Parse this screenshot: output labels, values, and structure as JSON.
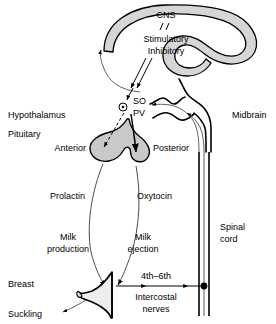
{
  "figure": {
    "background": "#ffffff",
    "width": 276,
    "height": 324
  },
  "colors": {
    "stroke": "#000000",
    "cns_fill": "#d6d6d6",
    "pituitary_fill": "#c9c9c9",
    "breast_fill": "#ededed",
    "thin_stroke": "#4d4d4d"
  },
  "labels": {
    "cns": "CNS",
    "stimulatory": "Stimulatory",
    "inhibitory": "Inhibitory",
    "hypothalamus": "Hypothalamus",
    "pituitary": "Pituitary",
    "so": "SO",
    "pv": "PV",
    "anterior": "Anterior",
    "posterior": "Posterior",
    "midbrain": "Midbrain",
    "prolactin": "Prolactin",
    "oxytocin": "Oxytocin",
    "milk_production_line1": "Milk",
    "milk_production_line2": "production",
    "milk_ejection_line1": "Milk",
    "milk_ejection_line2": "ejection",
    "breast": "Breast",
    "suckling": "Suckling",
    "spinal_cord_line1": "Spinal",
    "spinal_cord_line2": "cord",
    "nerves_level": "4th–6th",
    "nerves_line1": "Intercostal",
    "nerves_line2": "nerves"
  },
  "structures": [
    {
      "name": "cns",
      "label": "CNS",
      "type": "shaded-hook"
    },
    {
      "name": "pituitary-gland",
      "label": "Pituitary",
      "type": "shaded-bilobed"
    },
    {
      "name": "breast",
      "label": "Breast",
      "type": "shaded-profile"
    },
    {
      "name": "spinal-cord",
      "label": "Spinal cord",
      "type": "double-line"
    },
    {
      "name": "brainstem-midbrain",
      "label": "Midbrain",
      "type": "wavy-outline"
    },
    {
      "name": "supraoptic-paraventricular-nuclei",
      "label": "SO PV",
      "type": "nucleus-marker"
    }
  ],
  "pathways": [
    {
      "name": "cns-to-hypothalamus",
      "label": "Stimulatory Inhibitory",
      "style": "double-line-arrow"
    },
    {
      "name": "afferent-to-cns",
      "label": "",
      "style": "thin-curve-arrow"
    },
    {
      "name": "hypothalamus-to-anterior-pituitary",
      "label": "Prolactin",
      "style": "dashed-arrow"
    },
    {
      "name": "hypothalamus-to-posterior-pituitary",
      "label": "Oxytocin",
      "style": "solid-arrow"
    },
    {
      "name": "prolactin-to-breast",
      "label": "Milk production",
      "style": "thin-curve-arrow"
    },
    {
      "name": "oxytocin-to-breast",
      "label": "Milk ejection",
      "style": "thin-curve-arrow"
    },
    {
      "name": "suckling-afferent",
      "label": "Suckling",
      "style": "thin-curve-arrow"
    },
    {
      "name": "intercostal-afferent",
      "label": "4th–6th Intercostal nerves",
      "style": "straight-arrow"
    },
    {
      "name": "spinal-ascending",
      "label": "",
      "style": "thin-line-arrow"
    }
  ]
}
